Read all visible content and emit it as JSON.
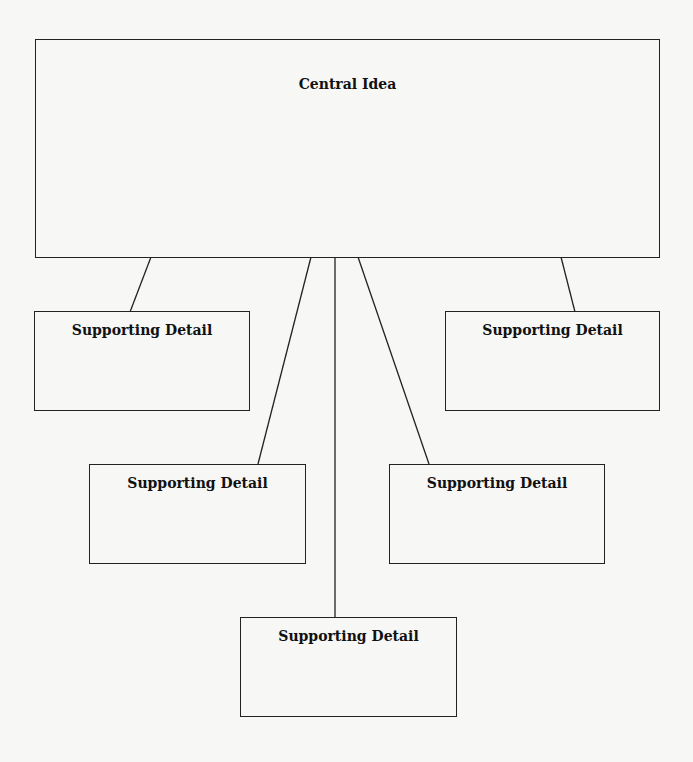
{
  "diagram": {
    "type": "main-idea-supporting-details",
    "central": {
      "label": "Central Idea"
    },
    "details": [
      {
        "label": "Supporting Detail"
      },
      {
        "label": "Supporting Detail"
      },
      {
        "label": "Supporting Detail"
      },
      {
        "label": "Supporting Detail"
      },
      {
        "label": "Supporting Detail"
      }
    ],
    "colors": {
      "background": "#f7f7f6",
      "line": "#222222",
      "text": "#111111"
    }
  }
}
